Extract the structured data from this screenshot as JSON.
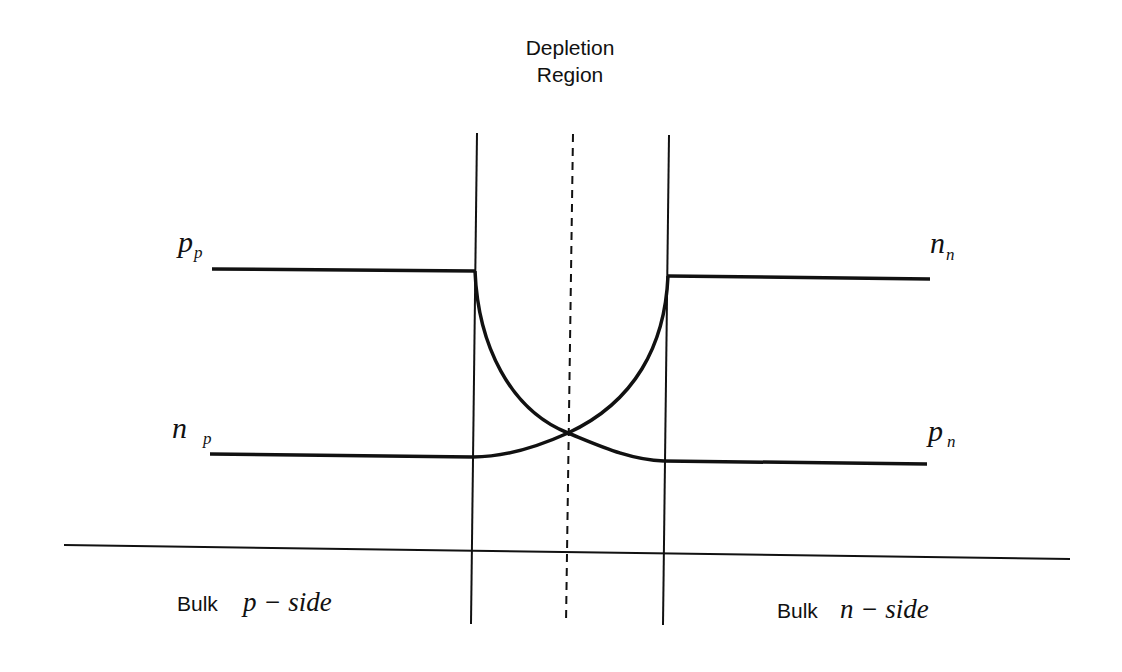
{
  "diagram": {
    "title_line1": "Depletion",
    "title_line2": "Region",
    "labels": {
      "pp_main": "p",
      "pp_sub": "p",
      "np_main": "n",
      "np_sub": "p",
      "nn_main": "n",
      "nn_sub": "n",
      "pn_main": "p",
      "pn_sub": "n"
    },
    "bulk_p": {
      "prefix": "Bulk",
      "italic": "p − side"
    },
    "bulk_n": {
      "prefix": "Bulk",
      "italic": "n − side"
    },
    "line_color": "#111111"
  }
}
